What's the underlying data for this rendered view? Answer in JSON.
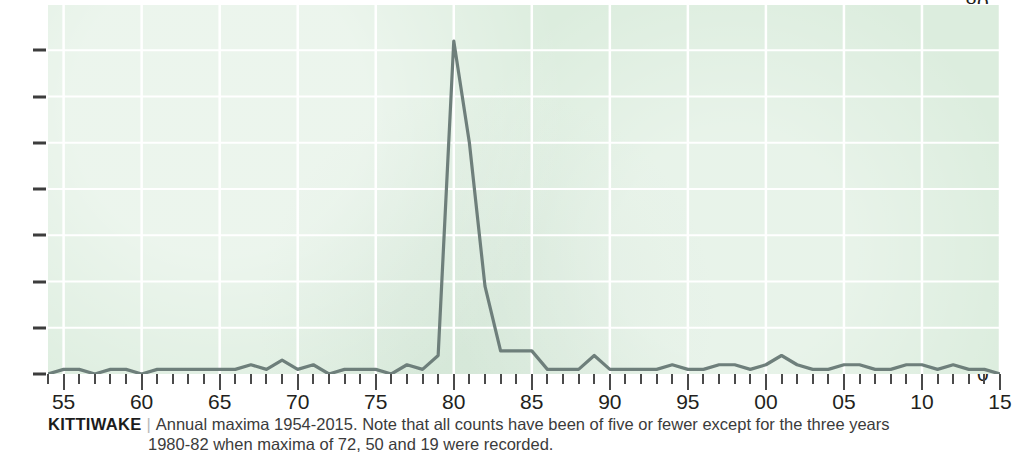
{
  "figure": {
    "caption_title": "KITTIWAKE",
    "caption_separator": "|",
    "caption_line1": "Annual maxima 1954-2015. Note that all counts have been of five or fewer except for the three years",
    "caption_line2": "1980-82 when maxima of 72, 50 and 19 were recorded."
  },
  "colors": {
    "plot_background": "#dcedde",
    "gridline": "#ffffff",
    "series_line": "#6e7f7b",
    "tick": "#4a4a4a",
    "label_text": "#231f20",
    "caption_text": "#3b3b3b"
  },
  "chart_data": {
    "type": "line",
    "title": "KITTIWAKE",
    "subtitle": "Annual maxima 1954-2015. Note that all counts have been of five or fewer except for the three years 1980-82 when maxima of 72, 50 and 19 were recorded.",
    "xlabel": "",
    "ylabel": "",
    "xlim": [
      1954,
      2015
    ],
    "ylim": [
      0,
      80
    ],
    "grid": true,
    "legend": "none",
    "y_ticks": [
      0,
      10,
      20,
      30,
      40,
      50,
      60,
      70,
      80
    ],
    "x_major_ticks": [
      1955,
      1960,
      1965,
      1970,
      1975,
      1980,
      1985,
      1990,
      1995,
      2000,
      2005,
      2010,
      2015
    ],
    "x_major_tick_labels": [
      "55",
      "60",
      "65",
      "70",
      "75",
      "80",
      "85",
      "90",
      "95",
      "00",
      "05",
      "10",
      "15"
    ],
    "series": [
      {
        "name": "Annual maximum count",
        "x": [
          1954,
          1955,
          1956,
          1957,
          1958,
          1959,
          1960,
          1961,
          1962,
          1963,
          1964,
          1965,
          1966,
          1967,
          1968,
          1969,
          1970,
          1971,
          1972,
          1973,
          1974,
          1975,
          1976,
          1977,
          1978,
          1979,
          1980,
          1981,
          1982,
          1983,
          1984,
          1985,
          1986,
          1987,
          1988,
          1989,
          1990,
          1991,
          1992,
          1993,
          1994,
          1995,
          1996,
          1997,
          1998,
          1999,
          2000,
          2001,
          2002,
          2003,
          2004,
          2005,
          2006,
          2007,
          2008,
          2009,
          2010,
          2011,
          2012,
          2013,
          2014,
          2015
        ],
        "values": [
          0,
          1,
          1,
          0,
          1,
          1,
          0,
          1,
          1,
          1,
          1,
          1,
          1,
          2,
          1,
          3,
          1,
          2,
          0,
          1,
          1,
          1,
          0,
          2,
          1,
          4,
          72,
          50,
          19,
          5,
          5,
          5,
          1,
          1,
          1,
          4,
          1,
          1,
          1,
          1,
          2,
          1,
          1,
          2,
          2,
          1,
          2,
          4,
          2,
          1,
          1,
          2,
          2,
          1,
          1,
          2,
          2,
          1,
          2,
          1,
          1,
          0
        ]
      }
    ]
  }
}
